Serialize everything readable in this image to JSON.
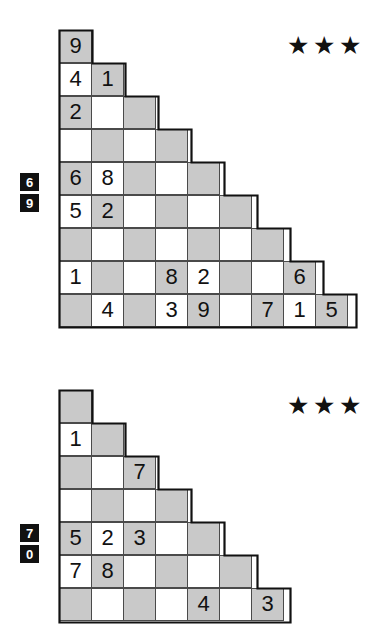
{
  "page": {
    "background_color": "#ffffff",
    "cell_size_px": 33,
    "shaded_cell_color": "#c9c9c9",
    "empty_cell_color": "#ffffff",
    "grid_line_color": "#4a4a4a",
    "outline_color": "#111111",
    "clue_box_color": "#111111",
    "clue_text_color": "#ffffff",
    "star_color": "#111111"
  },
  "puzzles": [
    {
      "id": "puzzle-1",
      "difficulty": {
        "label": "3 stars",
        "filled": 3,
        "total": 3,
        "glyph": "★"
      },
      "clues": [
        "6",
        "9"
      ],
      "rows": [
        {
          "index": 1,
          "cells": [
            "9"
          ]
        },
        {
          "index": 2,
          "cells": [
            "4",
            "1"
          ]
        },
        {
          "index": 3,
          "cells": [
            "2",
            "",
            ""
          ]
        },
        {
          "index": 4,
          "cells": [
            "",
            "",
            "",
            ""
          ]
        },
        {
          "index": 5,
          "cells": [
            "6",
            "8",
            "",
            "",
            ""
          ]
        },
        {
          "index": 6,
          "cells": [
            "5",
            "2",
            "",
            "",
            "",
            ""
          ]
        },
        {
          "index": 7,
          "cells": [
            "",
            "",
            "",
            "",
            "",
            "",
            ""
          ]
        },
        {
          "index": 8,
          "cells": [
            "1",
            "",
            "",
            "8",
            "2",
            "",
            "",
            "6"
          ]
        },
        {
          "index": 9,
          "cells": [
            "",
            "4",
            "",
            "3",
            "9",
            "",
            "7",
            "1",
            "5"
          ]
        }
      ]
    },
    {
      "id": "puzzle-2",
      "difficulty": {
        "label": "3 stars",
        "filled": 3,
        "total": 3,
        "glyph": "★"
      },
      "clues": [
        "7",
        "0"
      ],
      "rows": [
        {
          "index": 1,
          "cells": [
            ""
          ]
        },
        {
          "index": 2,
          "cells": [
            "1",
            ""
          ]
        },
        {
          "index": 3,
          "cells": [
            "",
            "",
            "7"
          ]
        },
        {
          "index": 4,
          "cells": [
            "",
            "",
            "",
            ""
          ]
        },
        {
          "index": 5,
          "cells": [
            "5",
            "2",
            "3",
            "",
            ""
          ]
        },
        {
          "index": 6,
          "cells": [
            "7",
            "8",
            "",
            "",
            "",
            ""
          ]
        },
        {
          "index": 7,
          "cells": [
            "",
            "",
            "",
            "",
            "4",
            "",
            "3"
          ]
        }
      ]
    }
  ]
}
